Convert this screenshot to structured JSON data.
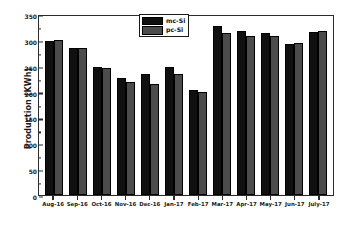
{
  "chart_data": {
    "type": "bar",
    "title": "",
    "xlabel": "",
    "ylabel": "Production (KWh)",
    "ylim": [
      0,
      350
    ],
    "ytick_step": 50,
    "yticks": [
      0,
      50,
      100,
      150,
      200,
      250,
      300,
      350
    ],
    "grid": false,
    "legend_position": "top-center",
    "categories": [
      "Aug-16",
      "Sep-16",
      "Oct-16",
      "Nov-16",
      "Dec-16",
      "Jan-17",
      "Feb-17",
      "Mar-17",
      "Apr-17",
      "May-17",
      "Jun-17",
      "July-17"
    ],
    "series": [
      {
        "name": "mc-Si",
        "color": "#101010",
        "values": [
          298,
          285,
          247,
          227,
          234,
          248,
          203,
          327,
          317,
          314,
          292,
          316
        ]
      },
      {
        "name": "pc-Si",
        "color": "#4c4c4c",
        "values": [
          299,
          284,
          245,
          218,
          215,
          234,
          199,
          313,
          308,
          307,
          294,
          318
        ]
      }
    ]
  },
  "axis": {
    "y_title": "Production (KWh)",
    "y_tick_labels": [
      "350",
      "300",
      "250",
      "200",
      "150",
      "100",
      "50",
      "0"
    ]
  },
  "legend": {
    "entries": [
      {
        "label": "mc-Si",
        "swatch": "#101010"
      },
      {
        "label": "pc-Si",
        "swatch": "#4c4c4c"
      }
    ]
  }
}
